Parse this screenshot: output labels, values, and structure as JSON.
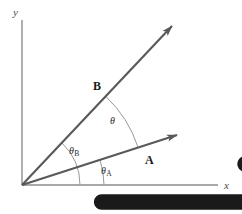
{
  "figure": {
    "caption": "(a)",
    "axes": {
      "x_label": "x",
      "y_label": "y",
      "origin": [
        22,
        185
      ],
      "x_end": [
        218,
        185
      ],
      "y_end": [
        22,
        20
      ]
    },
    "vectors": [
      {
        "name": "A",
        "label": "A",
        "label_pos": [
          146,
          152
        ],
        "tip": [
          177,
          135
        ],
        "angle_deg": 17.9,
        "color": "#595959"
      },
      {
        "name": "B",
        "label": "B",
        "label_pos": [
          94,
          78
        ],
        "tip": [
          172,
          26
        ],
        "angle_deg": 46.7,
        "color": "#595959"
      }
    ],
    "angles": [
      {
        "name": "theta-A",
        "label": "θ",
        "subscript": "A",
        "label_pos": [
          101,
          166
        ],
        "arc_radius": 82,
        "from_deg": 0,
        "to_deg": 17.9
      },
      {
        "name": "theta-B",
        "label": "θ",
        "subscript": "B",
        "label_pos": [
          69,
          146
        ],
        "arc_radius": 58,
        "from_deg": 0,
        "to_deg": 46.7
      },
      {
        "name": "theta",
        "label": "θ",
        "subscript": "",
        "label_pos": [
          110,
          116
        ],
        "arc_radius": 122,
        "from_deg": 17.9,
        "to_deg": 46.7
      }
    ],
    "colors": {
      "vector": "#595959",
      "axis": "#8d8d8d",
      "arc": "#8d8d8d",
      "text": "#231f20"
    }
  }
}
